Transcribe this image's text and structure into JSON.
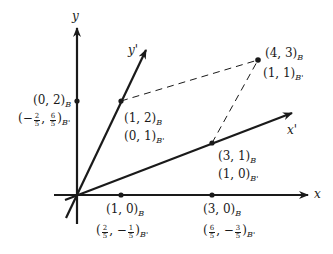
{
  "diagram": {
    "type": "change-of-basis coordinate diagram",
    "axes": {
      "x": {
        "label": "x"
      },
      "y": {
        "label": "y"
      },
      "x_prime": {
        "label": "x'"
      },
      "y_prime": {
        "label": "y'"
      }
    },
    "points": [
      {
        "id": "p02",
        "B": "(0, 2)",
        "B_sub": "B",
        "Bprime_pre": "(−",
        "Bprime_frac1": [
          "2",
          "5"
        ],
        "Bprime_sep": ", ",
        "Bprime_frac2": [
          "6",
          "5"
        ],
        "Bprime_post": ")",
        "Bprime_sub": "B'"
      },
      {
        "id": "p12",
        "B": "(1, 2)",
        "B_sub": "B",
        "Bprime": "(0, 1)",
        "Bprime_sub": "B'"
      },
      {
        "id": "p43",
        "B": "(4, 3)",
        "B_sub": "B",
        "Bprime": "(1, 1)",
        "Bprime_sub": "B'"
      },
      {
        "id": "p31",
        "B": "(3, 1)",
        "B_sub": "B",
        "Bprime": "(1, 0)",
        "Bprime_sub": "B'"
      },
      {
        "id": "p10",
        "B": "(1, 0)",
        "B_sub": "B",
        "Bprime_pre": "(",
        "Bprime_frac1": [
          "2",
          "5"
        ],
        "Bprime_sep": ", −",
        "Bprime_frac2": [
          "1",
          "5"
        ],
        "Bprime_post": ")",
        "Bprime_sub": "B'"
      },
      {
        "id": "p30",
        "B": "(3, 0)",
        "B_sub": "B",
        "Bprime_pre": "(",
        "Bprime_frac1": [
          "6",
          "5"
        ],
        "Bprime_sep": ", −",
        "Bprime_frac2": [
          "3",
          "5"
        ],
        "Bprime_post": ")",
        "Bprime_sub": "B'"
      }
    ],
    "colors": {
      "ink": "#1a1a1a",
      "background": "#ffffff"
    }
  }
}
